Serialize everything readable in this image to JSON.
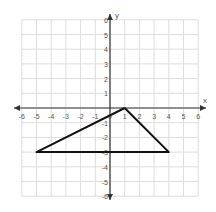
{
  "chart_data": {
    "type": "line",
    "title": "",
    "xlabel": "x",
    "ylabel": "y",
    "xlim": [
      -6,
      6
    ],
    "ylim": [
      -6,
      6
    ],
    "grid": true,
    "x_ticks": [
      "-6",
      "-5",
      "-4",
      "-3",
      "-2",
      "-1",
      "0",
      "1",
      "2",
      "3",
      "4",
      "5",
      "6"
    ],
    "y_ticks": [
      "-6",
      "-5",
      "-4",
      "-3",
      "-2",
      "-1",
      "1",
      "2",
      "3",
      "4",
      "5",
      "6"
    ],
    "series": [
      {
        "name": "triangle",
        "points": [
          [
            1,
            0
          ],
          [
            4,
            -3
          ],
          [
            -5,
            -3
          ],
          [
            1,
            0
          ]
        ]
      }
    ]
  }
}
